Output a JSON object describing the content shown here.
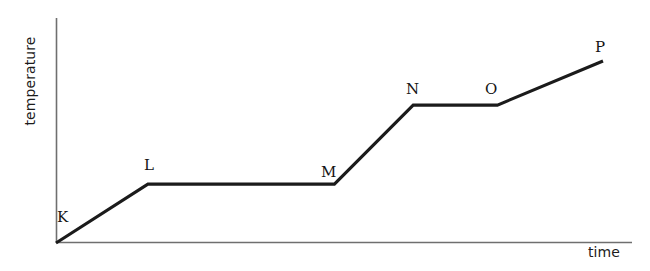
{
  "figure": {
    "width": 650,
    "height": 271,
    "background_color": "#ffffff"
  },
  "axes": {
    "x_label": "time",
    "y_label": "temperature",
    "axis_color": "#6f6f6f",
    "line_color": "#1b1b1b"
  },
  "chart_data": {
    "type": "line",
    "title": "",
    "subtitle": "",
    "xlabel": "time",
    "ylabel": "temperature",
    "xlim": [
      0,
      100
    ],
    "ylim": [
      0,
      100
    ],
    "grid": false,
    "legend": false,
    "axis_ticks": false,
    "axis_tick_labels": false,
    "series": [
      {
        "name": "temperature",
        "color": "#1b1b1b",
        "points": [
          {
            "label": "K",
            "x": 0.0,
            "y": 0.0
          },
          {
            "label": "L",
            "x": 16.8,
            "y": 26.2
          },
          {
            "label": "M",
            "x": 50.9,
            "y": 26.2
          },
          {
            "label": "N",
            "x": 65.3,
            "y": 61.3
          },
          {
            "label": "O",
            "x": 80.7,
            "y": 61.3
          },
          {
            "label": "P",
            "x": 100.0,
            "y": 80.9
          }
        ]
      }
    ],
    "segments": [
      {
        "from": "K",
        "to": "L",
        "shape": "rising"
      },
      {
        "from": "L",
        "to": "M",
        "shape": "plateau"
      },
      {
        "from": "M",
        "to": "N",
        "shape": "rising"
      },
      {
        "from": "N",
        "to": "O",
        "shape": "plateau"
      },
      {
        "from": "O",
        "to": "P",
        "shape": "rising"
      }
    ]
  },
  "point_labels": [
    {
      "text": "K",
      "left": 57,
      "top": 210
    },
    {
      "text": "L",
      "left": 144,
      "top": 158
    },
    {
      "text": "M",
      "left": 321,
      "top": 165
    },
    {
      "text": "N",
      "left": 406,
      "top": 82
    },
    {
      "text": "O",
      "left": 485,
      "top": 82
    },
    {
      "text": "P",
      "left": 595,
      "top": 40
    }
  ]
}
